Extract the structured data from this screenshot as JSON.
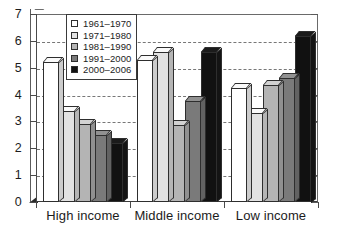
{
  "chart_data": {
    "type": "bar",
    "title": "",
    "subtitle": "",
    "xlabel": "",
    "ylabel": "",
    "categories": [
      "High income",
      "Middle income",
      "Low income"
    ],
    "series": [
      {
        "name": "1961–1970",
        "color": "#ffffff",
        "values": [
          5.2,
          5.3,
          4.25
        ]
      },
      {
        "name": "1971–1980",
        "color": "#e2e2e2",
        "values": [
          3.4,
          5.6,
          3.3
        ]
      },
      {
        "name": "1981–1990",
        "color": "#b4b4b4",
        "values": [
          2.9,
          2.85,
          4.35
        ]
      },
      {
        "name": "1991–2000",
        "color": "#7a7a7a",
        "values": [
          2.5,
          3.75,
          4.6
        ]
      },
      {
        "name": "2000–2006",
        "color": "#111111",
        "values": [
          2.2,
          5.6,
          6.2
        ]
      }
    ],
    "ylim": [
      0,
      7
    ],
    "yticks": [
      0,
      1,
      2,
      3,
      4,
      5,
      6,
      7
    ],
    "ytick_labels": [
      "0",
      "1",
      "2",
      "3",
      "4",
      "5",
      "6",
      "7"
    ],
    "grid": true,
    "grid_axis": "y",
    "grid_style": "dashed",
    "legend_position": "upper left",
    "bar_style": "3d"
  },
  "legend": {
    "items": [
      {
        "label": "1961–1970"
      },
      {
        "label": "1971–1980"
      },
      {
        "label": "1981–1990"
      },
      {
        "label": "1991–2000"
      },
      {
        "label": "2000–2006"
      }
    ]
  },
  "axes": {
    "y_labels": [
      "7",
      "6",
      "5",
      "4",
      "3",
      "2",
      "1",
      "0"
    ],
    "x_labels": [
      "High income",
      "Middle income",
      "Low income"
    ]
  }
}
